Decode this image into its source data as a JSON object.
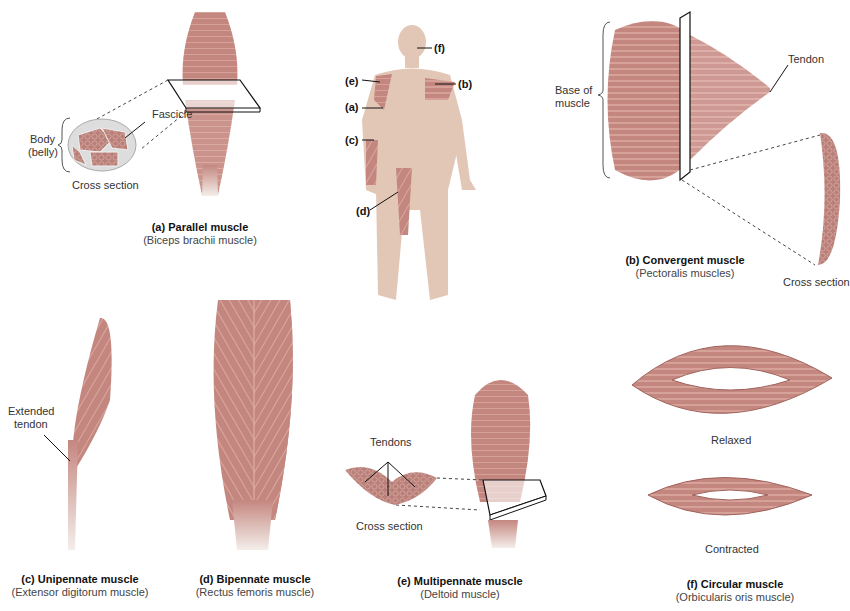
{
  "figure": {
    "muscle_color": "#c4877f",
    "muscle_dark": "#a0625b",
    "skin_color": "#e3c7b6",
    "panels": [
      {
        "id": "a",
        "title": "(a) Parallel muscle",
        "subtitle": "(Biceps brachii muscle)",
        "labels": {
          "body": "Body",
          "belly": "(belly)",
          "fascicle": "Fascicle",
          "cross_section": "Cross section"
        }
      },
      {
        "id": "b",
        "title": "(b) Convergent muscle",
        "subtitle": "(Pectoralis muscles)",
        "labels": {
          "base1": "Base of",
          "base2": "muscle",
          "tendon": "Tendon",
          "cross_section": "Cross section"
        }
      },
      {
        "id": "c",
        "title": "(c) Unipennate muscle",
        "subtitle": "(Extensor digitorum muscle)",
        "labels": {
          "ext1": "Extended",
          "ext2": "tendon"
        }
      },
      {
        "id": "d",
        "title": "(d) Bipennate muscle",
        "subtitle": "(Rectus femoris muscle)",
        "labels": {}
      },
      {
        "id": "e",
        "title": "(e) Multipennate muscle",
        "subtitle": "(Deltoid muscle)",
        "labels": {
          "tendons": "Tendons",
          "cross_section": "Cross section"
        }
      },
      {
        "id": "f",
        "title": "(f) Circular muscle",
        "subtitle": "(Orbicularis oris muscle)",
        "labels": {
          "relaxed": "Relaxed",
          "contracted": "Contracted"
        }
      }
    ],
    "body_markers": [
      "(f)",
      "(e)",
      "(b)",
      "(a)",
      "(c)",
      "(d)"
    ]
  }
}
